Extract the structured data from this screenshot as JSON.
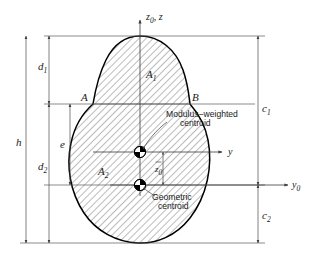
{
  "figure": {
    "background_color": "#ffffff",
    "line_color": "#000000",
    "hatch_color": "#555555"
  },
  "axes": [
    {
      "id": "z-axis",
      "label": "z",
      "label_prefix": "z",
      "label_subscript": "0",
      "label_suffix": ", z",
      "full_label": "z0, z",
      "direction": "up"
    },
    {
      "id": "y-axis",
      "label": "y",
      "full_label": "y",
      "direction": "right"
    },
    {
      "id": "y0-axis",
      "label": "y",
      "label_subscript": "0",
      "full_label": "y0",
      "direction": "right"
    }
  ],
  "dimensions": [
    {
      "id": "h",
      "label": "h",
      "subscript": ""
    },
    {
      "id": "d1",
      "label": "d",
      "subscript": "1"
    },
    {
      "id": "d2",
      "label": "d",
      "subscript": "2"
    },
    {
      "id": "e",
      "label": "e",
      "subscript": ""
    },
    {
      "id": "c1",
      "label": "c",
      "subscript": "1"
    },
    {
      "id": "c2",
      "label": "c",
      "subscript": "2"
    },
    {
      "id": "zbar0",
      "label": "z",
      "subscript": "0",
      "overbar": true
    }
  ],
  "areas": [
    {
      "id": "A1",
      "label": "A",
      "subscript": "1"
    },
    {
      "id": "A2",
      "label": "A",
      "subscript": "2"
    }
  ],
  "points": [
    {
      "id": "A",
      "label": "A"
    },
    {
      "id": "B",
      "label": "B"
    }
  ],
  "callouts": [
    {
      "id": "modulus-weighted-centroid",
      "line1": "Modulus−weighted",
      "line2": "centroid"
    },
    {
      "id": "geometric-centroid",
      "line1": "Geometric",
      "line2": "centroid"
    }
  ],
  "markers": [
    {
      "id": "modulus-weighted-centroid-marker",
      "type": "centroid-symbol"
    },
    {
      "id": "geometric-centroid-marker",
      "type": "centroid-symbol"
    }
  ]
}
